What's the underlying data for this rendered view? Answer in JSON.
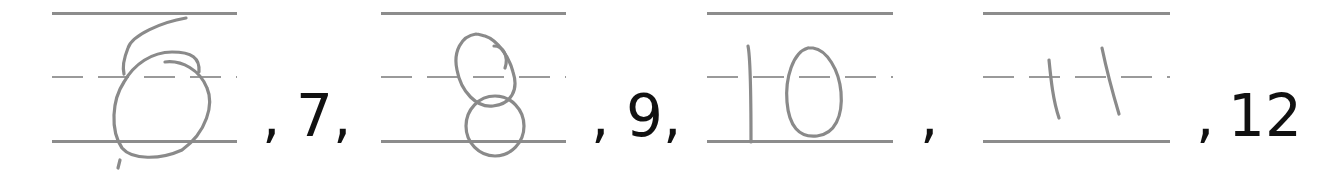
{
  "worksheet": {
    "task": "number sequence with handwritten missing numbers",
    "sequence": [
      {
        "type": "handwritten",
        "value": "6"
      },
      {
        "type": "printed",
        "value": "7"
      },
      {
        "type": "handwritten",
        "value": "8"
      },
      {
        "type": "printed",
        "value": "9"
      },
      {
        "type": "handwritten",
        "value": "10"
      },
      {
        "type": "handwritten",
        "value": "11"
      },
      {
        "type": "printed",
        "value": "12"
      }
    ],
    "printed": {
      "sep1": ",",
      "n7": "7,",
      "sep2": ",",
      "n9": "9,",
      "sep3": ",",
      "sep4": ",",
      "n12": "12"
    },
    "answers": {
      "box1": "6",
      "box2": "8",
      "box3": "10",
      "box4": "11"
    },
    "colors": {
      "guide_line": "#8c8c8c",
      "handwriting": "#8a8a8a",
      "printed_text": "#111111"
    }
  }
}
